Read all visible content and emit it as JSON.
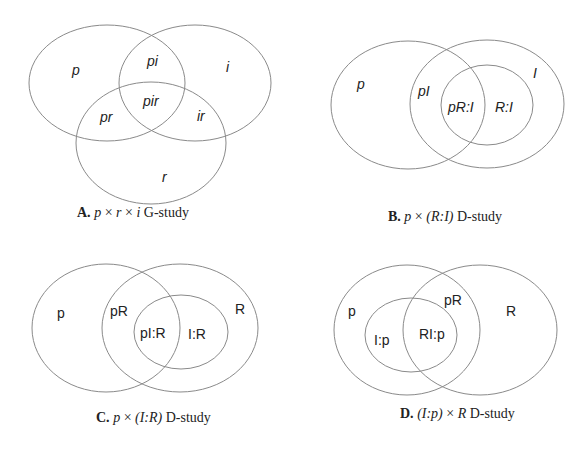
{
  "figure": {
    "stroke_color": "#8a8a8a",
    "panels": [
      {
        "id": "A",
        "caption": {
          "letter": "A.",
          "formula_parts": [
            "p",
            " × ",
            "r",
            " × ",
            "i"
          ],
          "suffix": " G-study"
        },
        "ellipses": [
          {
            "name": "p",
            "cx": 107,
            "cy": 83,
            "rx": 78,
            "ry": 58
          },
          {
            "name": "i",
            "cx": 195,
            "cy": 83,
            "rx": 76,
            "ry": 58
          },
          {
            "name": "r",
            "cx": 151,
            "cy": 143,
            "rx": 75,
            "ry": 61
          }
        ],
        "labels": [
          {
            "text": "p",
            "x": 72,
            "y": 75
          },
          {
            "text": "pi",
            "x": 147,
            "y": 66
          },
          {
            "text": "i",
            "x": 226,
            "y": 72
          },
          {
            "text": "pir",
            "x": 143,
            "y": 106
          },
          {
            "text": "pr",
            "x": 100,
            "y": 122
          },
          {
            "text": "ir",
            "x": 197,
            "y": 121
          },
          {
            "text": "r",
            "x": 162,
            "y": 182
          }
        ]
      },
      {
        "id": "B",
        "caption": {
          "letter": "B.",
          "formula_parts": [
            "p",
            " × ",
            "(R:I)"
          ],
          "suffix": " D-study"
        },
        "ellipses": [
          {
            "name": "p",
            "cx": 408,
            "cy": 105,
            "rx": 77,
            "ry": 64
          },
          {
            "name": "I",
            "cx": 487,
            "cy": 104,
            "rx": 77,
            "ry": 64
          },
          {
            "name": "R:I",
            "cx": 487,
            "cy": 105,
            "rx": 46,
            "ry": 40
          }
        ],
        "labels": [
          {
            "text": "p",
            "x": 357,
            "y": 89
          },
          {
            "text": "pI",
            "x": 418,
            "y": 96
          },
          {
            "text": "I",
            "x": 533,
            "y": 78
          },
          {
            "text": "pR:I",
            "x": 448,
            "y": 112
          },
          {
            "text": "R:I",
            "x": 495,
            "y": 112
          }
        ]
      },
      {
        "id": "C",
        "caption": {
          "letter": "C.",
          "formula_parts": [
            "p",
            " × ",
            "(I:R)"
          ],
          "suffix": " D-study"
        },
        "ellipses": [
          {
            "name": "p",
            "cx": 106,
            "cy": 328,
            "rx": 74,
            "ry": 64
          },
          {
            "name": "R",
            "cx": 180,
            "cy": 328,
            "rx": 78,
            "ry": 64
          },
          {
            "name": "I:R",
            "cx": 181,
            "cy": 332,
            "rx": 47,
            "ry": 37
          }
        ],
        "labels": [
          {
            "text": "p",
            "x": 57,
            "y": 318
          },
          {
            "text": "pR",
            "x": 110,
            "y": 316
          },
          {
            "text": "R",
            "x": 235,
            "y": 314
          },
          {
            "text": "pI:R",
            "x": 140,
            "y": 338
          },
          {
            "text": "I:R",
            "x": 188,
            "y": 339
          }
        ]
      },
      {
        "id": "D",
        "caption": {
          "letter": "D.",
          "formula_parts": [
            "(I:p)",
            " × ",
            "R"
          ],
          "suffix": " D-study"
        },
        "ellipses": [
          {
            "name": "p",
            "cx": 407,
            "cy": 330,
            "rx": 73,
            "ry": 65
          },
          {
            "name": "R",
            "cx": 480,
            "cy": 330,
            "rx": 77,
            "ry": 65
          },
          {
            "name": "I:p",
            "cx": 411,
            "cy": 335,
            "rx": 46,
            "ry": 37
          }
        ],
        "labels": [
          {
            "text": "p",
            "x": 348,
            "y": 316
          },
          {
            "text": "pR",
            "x": 444,
            "y": 305
          },
          {
            "text": "R",
            "x": 506,
            "y": 316
          },
          {
            "text": "I:p",
            "x": 374,
            "y": 345
          },
          {
            "text": "RI:p",
            "x": 419,
            "y": 339
          }
        ]
      }
    ]
  }
}
